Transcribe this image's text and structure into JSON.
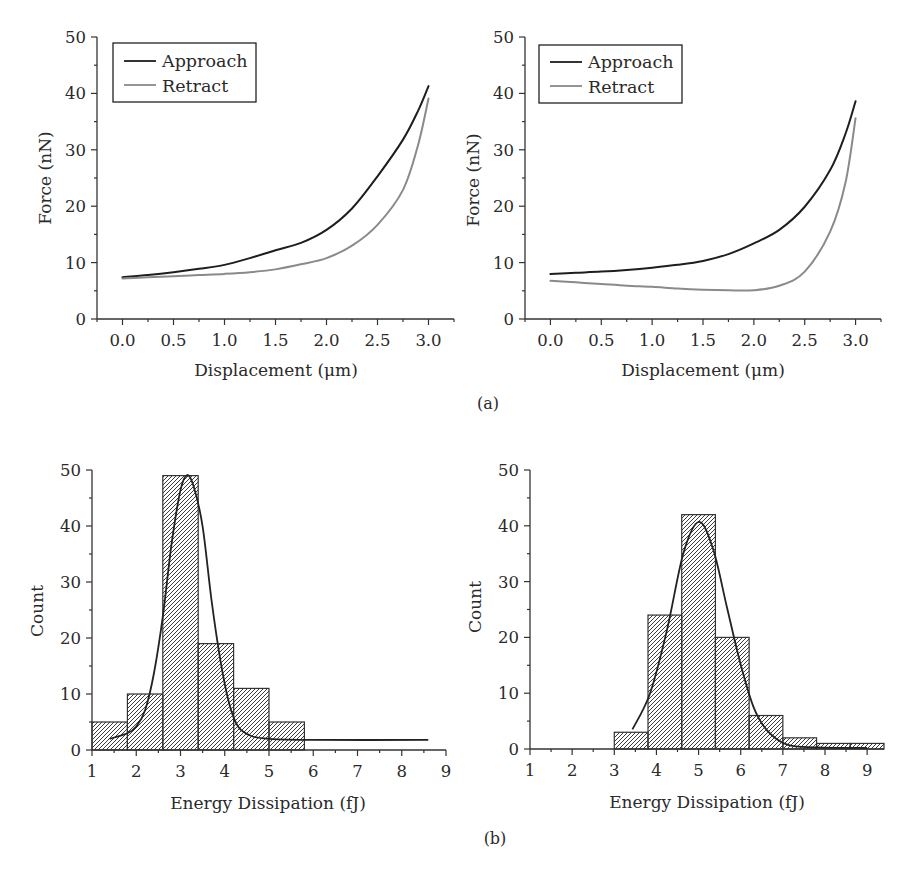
{
  "figure": {
    "panel_a_label": "(a)",
    "panel_b_label": "(b)"
  },
  "chart_data": [
    {
      "id": "a-left",
      "panel": "a",
      "type": "line",
      "title": "",
      "xlabel": "Displacement (μm)",
      "ylabel": "Force (nN)",
      "xlim": [
        -0.25,
        3.25
      ],
      "ylim": [
        0,
        50
      ],
      "xticks": [
        0,
        0.5,
        1,
        1.5,
        2,
        2.5,
        3
      ],
      "xtick_labels": [
        "0.0",
        "0.5",
        "1.0",
        "1.5",
        "2.0",
        "2.5",
        "3.0"
      ],
      "xminor_step": 0.25,
      "yticks": [
        0,
        10,
        20,
        30,
        40,
        50
      ],
      "ytick_labels": [
        "0",
        "10",
        "20",
        "30",
        "40",
        "50"
      ],
      "yminor_step": 5,
      "grid": false,
      "legend": {
        "position": "upper left",
        "entries": [
          {
            "label": "Approach",
            "color": "#1e1e1e"
          },
          {
            "label": "Retract",
            "color": "#8a8a8a"
          }
        ]
      },
      "series": [
        {
          "name": "Approach",
          "color": "#1e1e1e",
          "x": [
            0,
            0.25,
            0.5,
            0.75,
            1.0,
            1.25,
            1.5,
            1.75,
            2.0,
            2.25,
            2.5,
            2.75,
            2.9,
            3.0
          ],
          "y": [
            7.4,
            7.8,
            8.3,
            8.9,
            9.6,
            10.8,
            12.2,
            13.5,
            15.8,
            19.6,
            25.3,
            31.8,
            37.0,
            41.3
          ]
        },
        {
          "name": "Retract",
          "color": "#8a8a8a",
          "x": [
            0,
            0.25,
            0.5,
            0.75,
            1.0,
            1.25,
            1.5,
            1.75,
            2.0,
            2.25,
            2.5,
            2.75,
            2.9,
            3.0
          ],
          "y": [
            7.2,
            7.4,
            7.6,
            7.8,
            8.0,
            8.3,
            8.8,
            9.7,
            10.8,
            13.0,
            16.7,
            22.9,
            31.0,
            39.1
          ]
        }
      ]
    },
    {
      "id": "a-right",
      "panel": "a",
      "type": "line",
      "title": "",
      "xlabel": "Displacement (μm)",
      "ylabel": "Force (nN)",
      "xlim": [
        -0.25,
        3.25
      ],
      "ylim": [
        0,
        50
      ],
      "xticks": [
        0,
        0.5,
        1,
        1.5,
        2,
        2.5,
        3
      ],
      "xtick_labels": [
        "0.0",
        "0.5",
        "1.0",
        "1.5",
        "2.0",
        "2.5",
        "3.0"
      ],
      "xminor_step": 0.25,
      "yticks": [
        0,
        10,
        20,
        30,
        40,
        50
      ],
      "ytick_labels": [
        "0",
        "10",
        "20",
        "30",
        "40",
        "50"
      ],
      "yminor_step": 5,
      "grid": false,
      "legend": {
        "position": "upper left",
        "entries": [
          {
            "label": "Approach",
            "color": "#1e1e1e"
          },
          {
            "label": "Retract",
            "color": "#8a8a8a"
          }
        ]
      },
      "series": [
        {
          "name": "Approach",
          "color": "#1e1e1e",
          "x": [
            0,
            0.25,
            0.5,
            0.75,
            1.0,
            1.25,
            1.5,
            1.75,
            2.0,
            2.25,
            2.5,
            2.75,
            2.9,
            3.0
          ],
          "y": [
            8.0,
            8.2,
            8.4,
            8.7,
            9.1,
            9.6,
            10.3,
            11.5,
            13.4,
            15.8,
            19.9,
            26.4,
            32.8,
            38.6
          ]
        },
        {
          "name": "Retract",
          "color": "#8a8a8a",
          "x": [
            0,
            0.25,
            0.5,
            0.75,
            1.0,
            1.25,
            1.5,
            1.75,
            2.0,
            2.25,
            2.5,
            2.75,
            2.9,
            3.0
          ],
          "y": [
            6.8,
            6.5,
            6.2,
            5.9,
            5.7,
            5.4,
            5.2,
            5.1,
            5.1,
            5.9,
            8.4,
            15.5,
            24.1,
            35.6
          ]
        }
      ]
    },
    {
      "id": "b-left",
      "panel": "b",
      "type": "bar",
      "subtype": "histogram",
      "title": "",
      "xlabel": "Energy Dissipation (fJ)",
      "ylabel": "Count",
      "xlim": [
        1,
        9
      ],
      "ylim": [
        0,
        50
      ],
      "xticks": [
        1,
        2,
        3,
        4,
        5,
        6,
        7,
        8,
        9
      ],
      "xtick_labels": [
        "1",
        "2",
        "3",
        "4",
        "5",
        "6",
        "7",
        "8",
        "9"
      ],
      "xminor_step": 0.5,
      "yticks": [
        0,
        10,
        20,
        30,
        40,
        50
      ],
      "ytick_labels": [
        "0",
        "10",
        "20",
        "30",
        "40",
        "50"
      ],
      "yminor_step": 5,
      "grid": false,
      "bin_edges": [
        1.0,
        1.8,
        2.6,
        3.4,
        4.2,
        5.0,
        5.8
      ],
      "categories": [
        "1.0–1.8",
        "1.8–2.6",
        "2.6–3.4",
        "3.4–4.2",
        "4.2–5.0",
        "5.0–5.8"
      ],
      "values": [
        5,
        10,
        49,
        19,
        11,
        5
      ],
      "fit": {
        "name": "Gaussian fit",
        "x": [
          1.4,
          1.8,
          2.0,
          2.2,
          2.4,
          2.6,
          2.8,
          3.0,
          3.15,
          3.3,
          3.5,
          3.7,
          3.9,
          4.1,
          4.3,
          4.6,
          5.0,
          6.0,
          8.6
        ],
        "y": [
          2.0,
          3.0,
          4.2,
          7.1,
          13.7,
          23.8,
          36.9,
          46.4,
          49.1,
          47.0,
          39.9,
          26.8,
          16.1,
          8.3,
          4.2,
          2.5,
          2.0,
          1.8,
          1.8
        ]
      }
    },
    {
      "id": "b-right",
      "panel": "b",
      "type": "bar",
      "subtype": "histogram",
      "title": "",
      "xlabel": "Energy Dissipation (fJ)",
      "ylabel": "Count",
      "xlim": [
        1,
        9.4
      ],
      "ylim": [
        0,
        50
      ],
      "xticks": [
        1,
        2,
        3,
        4,
        5,
        6,
        7,
        8,
        9
      ],
      "xtick_labels": [
        "1",
        "2",
        "3",
        "4",
        "5",
        "6",
        "7",
        "8",
        "9"
      ],
      "xminor_step": 0.5,
      "yticks": [
        0,
        10,
        20,
        30,
        40,
        50
      ],
      "ytick_labels": [
        "0",
        "10",
        "20",
        "30",
        "40",
        "50"
      ],
      "yminor_step": 5,
      "grid": false,
      "bin_edges": [
        3.0,
        3.8,
        4.6,
        5.4,
        6.2,
        7.0,
        7.8,
        8.6,
        9.4
      ],
      "categories": [
        "3.0–3.8",
        "3.8–4.6",
        "4.6–5.4",
        "5.4–6.2",
        "6.2–7.0",
        "7.0–7.8",
        "7.8–8.6",
        "8.6–9.4"
      ],
      "values": [
        3,
        24,
        42,
        20,
        6,
        2,
        1,
        1
      ],
      "fit": {
        "name": "Gaussian fit",
        "x": [
          3.43,
          3.85,
          4.25,
          4.64,
          5.01,
          5.35,
          5.67,
          5.99,
          6.3,
          6.62,
          7.1,
          7.81,
          9.0
        ],
        "y": [
          3.5,
          10.0,
          21.3,
          35.1,
          40.7,
          35.7,
          25.5,
          15.4,
          7.6,
          3.4,
          0.8,
          0.3,
          0.2
        ]
      }
    }
  ]
}
